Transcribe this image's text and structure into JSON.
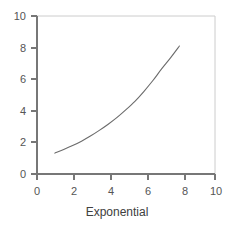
{
  "chart_data": {
    "type": "line",
    "title": "",
    "subtitle": "",
    "xlabel": "Exponential",
    "ylabel": "",
    "xlim": [
      0,
      10
    ],
    "ylim": [
      0,
      10
    ],
    "grid": false,
    "legend": null,
    "x_ticks": [
      0,
      2,
      4,
      6,
      8,
      10
    ],
    "y_ticks": [
      0,
      2,
      4,
      6,
      8,
      10
    ],
    "x_tick_labels": [
      "0",
      "2",
      "4",
      "6",
      "8",
      "10"
    ],
    "y_tick_labels": [
      "0",
      "2",
      "4",
      "6",
      "8",
      "10"
    ],
    "series": [
      {
        "name": "Exponential",
        "color": "#6b6b6b",
        "x": [
          1.0,
          1.5,
          2.0,
          2.5,
          3.0,
          3.5,
          4.0,
          4.5,
          5.0,
          5.5,
          6.0,
          6.5,
          7.0,
          7.5,
          8.0
        ],
        "y": [
          1.32,
          1.55,
          1.8,
          2.08,
          2.4,
          2.76,
          3.15,
          3.58,
          4.07,
          4.6,
          5.22,
          5.9,
          6.65,
          7.35,
          8.1
        ]
      }
    ]
  },
  "axis_labels": {
    "x_title": "Exponential"
  },
  "colors": {
    "curve": "#6b6b6b",
    "axis": "#777777",
    "frame": "#cccccc",
    "tick_text": "#555555",
    "title_text": "#404040",
    "background": "#ffffff"
  },
  "ticks": {
    "x": [
      {
        "value": "0",
        "px": 37
      },
      {
        "value": "2",
        "px": 74
      },
      {
        "value": "4",
        "px": 111
      },
      {
        "value": "6",
        "px": 148
      },
      {
        "value": "8",
        "px": 185
      },
      {
        "value": "10",
        "px": 215
      }
    ],
    "y": [
      {
        "value": "0",
        "px": 174
      },
      {
        "value": "2",
        "px": 142
      },
      {
        "value": "4",
        "px": 111
      },
      {
        "value": "6",
        "px": 79
      },
      {
        "value": "8",
        "px": 48
      },
      {
        "value": "10",
        "px": 16
      }
    ]
  }
}
